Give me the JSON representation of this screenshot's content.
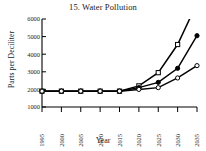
{
  "chart_data": {
    "type": "line",
    "title": "15. Water Pollution",
    "xlabel": "Year",
    "ylabel": "Parts per Deciliter",
    "x": [
      1995,
      2000,
      2005,
      2010,
      2015,
      2020,
      2025,
      2030,
      2035
    ],
    "xticks": [
      "1995",
      "2000",
      "2005",
      "2010",
      "2015",
      "2020",
      "2025",
      "2030",
      "2035"
    ],
    "yticks": [
      "1000",
      "2000",
      "3000",
      "4000",
      "5000",
      "6000"
    ],
    "ytick_values": [
      1000,
      2000,
      3000,
      4000,
      5000,
      6000
    ],
    "xlim": [
      1995,
      2035
    ],
    "ylim": [
      1000,
      6000
    ],
    "grid": false,
    "legend": "none",
    "series": [
      {
        "name": "open-square-series",
        "marker": "open-square",
        "values": [
          1900,
          1900,
          1900,
          1900,
          1900,
          2200,
          2950,
          4550,
          6900
        ],
        "clipped_above_axis": true
      },
      {
        "name": "filled-circle-series",
        "marker": "filled-circle",
        "values": [
          1900,
          1900,
          1900,
          1900,
          1900,
          2100,
          2400,
          3200,
          5050
        ]
      },
      {
        "name": "open-circle-series",
        "marker": "open-circle",
        "values": [
          1900,
          1900,
          1900,
          1900,
          1900,
          2000,
          2100,
          2650,
          3350
        ]
      }
    ],
    "colors": {
      "line": "#000000",
      "axis": "#000000",
      "background": "#ffffff"
    }
  }
}
